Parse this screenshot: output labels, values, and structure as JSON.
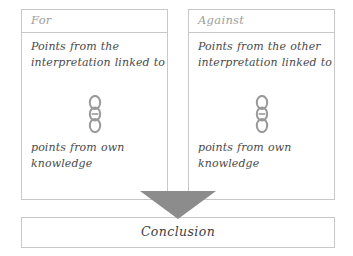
{
  "diagram": {
    "type": "argument-balance-organizer",
    "colors": {
      "border": "#c8c8c8",
      "header_text": "#9d9d9d",
      "body_text": "#4a4a4a",
      "arrow_fill": "#8c8c8c",
      "chain_stroke": "#9a9a9a",
      "background": "#ffffff"
    },
    "columns": [
      {
        "id": "for",
        "header": "For",
        "text_top": "Points from the interpretation linked to",
        "icon": "chain-link-icon",
        "text_bottom": "points from own knowledge"
      },
      {
        "id": "against",
        "header": "Against",
        "text_top": "Points from the other interpretation linked to",
        "icon": "chain-link-icon",
        "text_bottom": "points from own knowledge"
      }
    ],
    "arrow": {
      "icon": "arrow-down-icon",
      "direction": "down"
    },
    "conclusion": {
      "label": "Conclusion"
    }
  }
}
